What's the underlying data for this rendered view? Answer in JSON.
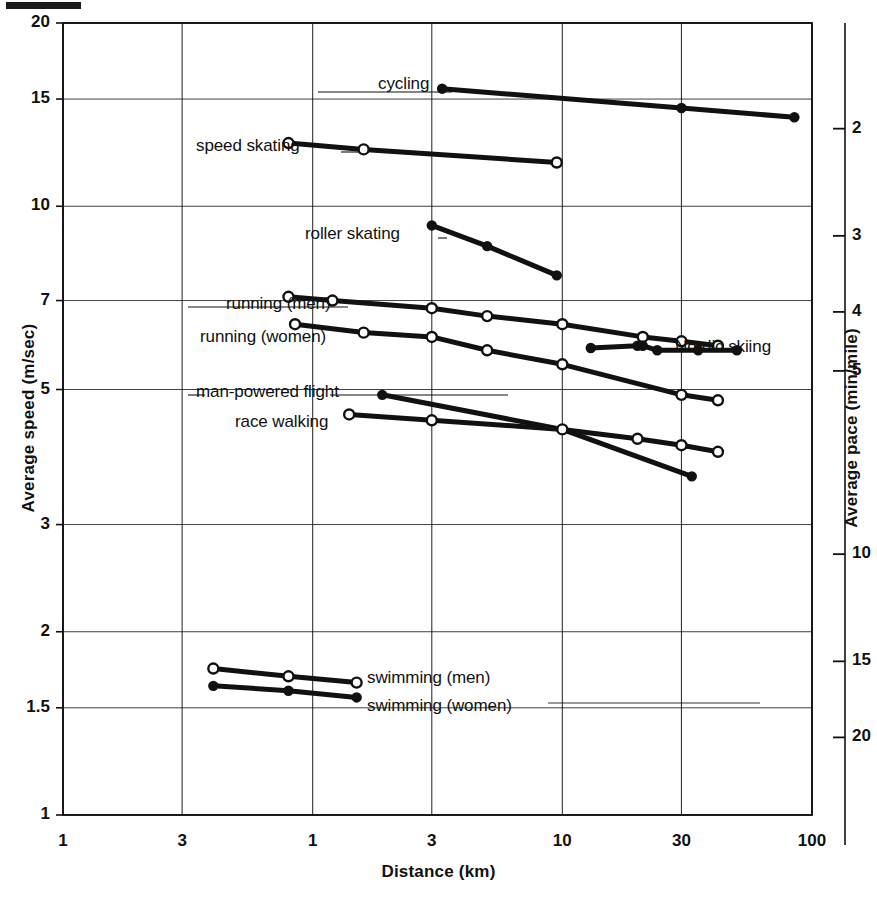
{
  "figure": {
    "kind": "scanned-line-chart",
    "background_color": "#ffffff",
    "ink_color": "#111111"
  },
  "axes": {
    "y_left": {
      "title": "Average speed (m/sec)",
      "ticks": [
        "20",
        "15",
        "10",
        "7",
        "5",
        "3",
        "2",
        "1.5",
        "1"
      ],
      "values": [
        20,
        15,
        10,
        7,
        5,
        3,
        2,
        1.5,
        1
      ],
      "scale": "log"
    },
    "y_right": {
      "title": "Average pace (min/mile)",
      "ticks": [
        "2",
        "3",
        "4",
        "5",
        "10",
        "15",
        "20"
      ],
      "values": [
        2,
        3,
        4,
        5,
        10,
        15,
        20
      ],
      "scale": "log"
    },
    "x": {
      "title": "Distance (km)",
      "ticks": [
        "1",
        "3",
        "1",
        "3",
        "10",
        "30",
        "100"
      ],
      "values": [
        0.1,
        0.3,
        1,
        3,
        10,
        30,
        100
      ],
      "scale": "log"
    }
  },
  "series_labels": {
    "cycling": "cycling",
    "speed_skating": "speed skating",
    "roller_skating": "roller skating",
    "running_men": "running (men)",
    "running_women": "running (women)",
    "man_powered_flight": "man-powered flight",
    "race_walking": "race walking",
    "nordic_skiing": "Nordic skiing",
    "swimming_men": "swimming (men)",
    "swimming_women": "swimming (women)"
  },
  "chart_data": {
    "type": "line",
    "title": "",
    "xlabel": "Distance (km)",
    "ylabel": "Average speed (m/sec)",
    "y2label": "Average pace (min/mile)",
    "xscale": "log",
    "yscale": "log",
    "xlim": [
      0.1,
      100
    ],
    "ylim": [
      1,
      20
    ],
    "y2lim": [
      2,
      20
    ],
    "grid": true,
    "legend": "inline-labels",
    "xticks": [
      0.1,
      0.3,
      1,
      3,
      10,
      30,
      100
    ],
    "xticklabels": [
      "1",
      "3",
      "1",
      "3",
      "10",
      "30",
      "100"
    ],
    "yticks": [
      1,
      1.5,
      2,
      3,
      5,
      7,
      10,
      15,
      20
    ],
    "yticklabels": [
      "1",
      "1.5",
      "2",
      "3",
      "5",
      "7",
      "10",
      "15",
      "20"
    ],
    "y2ticks": [
      2,
      3,
      4,
      5,
      10,
      15,
      20
    ],
    "y2ticklabels": [
      "2",
      "3",
      "4",
      "5",
      "10",
      "15",
      "20"
    ],
    "series": [
      {
        "name": "cycling",
        "marker": "filled-circle",
        "points": [
          {
            "x": 3.3,
            "y": 15.6
          },
          {
            "x": 30,
            "y": 14.5
          },
          {
            "x": 85,
            "y": 14.0
          }
        ]
      },
      {
        "name": "speed skating",
        "marker": "open-circle",
        "points": [
          {
            "x": 0.8,
            "y": 12.7
          },
          {
            "x": 1.6,
            "y": 12.4
          },
          {
            "x": 9.5,
            "y": 11.8
          }
        ]
      },
      {
        "name": "roller skating",
        "marker": "filled-circle",
        "points": [
          {
            "x": 3.0,
            "y": 9.3
          },
          {
            "x": 5.0,
            "y": 8.6
          },
          {
            "x": 9.5,
            "y": 7.7
          }
        ]
      },
      {
        "name": "running (men)",
        "marker": "open-circle",
        "points": [
          {
            "x": 0.8,
            "y": 7.1
          },
          {
            "x": 1.2,
            "y": 7.0
          },
          {
            "x": 3.0,
            "y": 6.8
          },
          {
            "x": 5.0,
            "y": 6.6
          },
          {
            "x": 10,
            "y": 6.4
          },
          {
            "x": 21,
            "y": 6.1
          },
          {
            "x": 30,
            "y": 6.0
          },
          {
            "x": 42,
            "y": 5.9
          }
        ]
      },
      {
        "name": "running (women)",
        "marker": "open-circle",
        "points": [
          {
            "x": 0.85,
            "y": 6.4
          },
          {
            "x": 1.6,
            "y": 6.2
          },
          {
            "x": 3.0,
            "y": 6.1
          },
          {
            "x": 5.0,
            "y": 5.8
          },
          {
            "x": 10,
            "y": 5.5
          },
          {
            "x": 30,
            "y": 4.9
          },
          {
            "x": 42,
            "y": 4.8
          }
        ]
      },
      {
        "name": "Nordic skiing",
        "marker": "filled-circle",
        "points": [
          {
            "x": 13,
            "y": 5.85
          },
          {
            "x": 20,
            "y": 5.9
          },
          {
            "x": 21,
            "y": 5.9
          },
          {
            "x": 24,
            "y": 5.8
          },
          {
            "x": 35,
            "y": 5.8
          },
          {
            "x": 50,
            "y": 5.8
          }
        ]
      },
      {
        "name": "man-powered flight",
        "marker": "filled-circle",
        "points": [
          {
            "x": 1.9,
            "y": 4.9
          },
          {
            "x": 10,
            "y": 4.3
          },
          {
            "x": 33,
            "y": 3.6
          }
        ]
      },
      {
        "name": "race walking",
        "marker": "open-circle",
        "points": [
          {
            "x": 1.4,
            "y": 4.55
          },
          {
            "x": 3.0,
            "y": 4.45
          },
          {
            "x": 10,
            "y": 4.3
          },
          {
            "x": 20,
            "y": 4.15
          },
          {
            "x": 30,
            "y": 4.05
          },
          {
            "x": 42,
            "y": 3.95
          }
        ]
      },
      {
        "name": "swimming (men)",
        "marker": "open-circle",
        "points": [
          {
            "x": 0.4,
            "y": 1.74
          },
          {
            "x": 0.8,
            "y": 1.69
          },
          {
            "x": 1.5,
            "y": 1.65
          }
        ]
      },
      {
        "name": "swimming (women)",
        "marker": "filled-circle",
        "points": [
          {
            "x": 0.4,
            "y": 1.63
          },
          {
            "x": 0.8,
            "y": 1.6
          },
          {
            "x": 1.5,
            "y": 1.56
          }
        ]
      }
    ]
  }
}
